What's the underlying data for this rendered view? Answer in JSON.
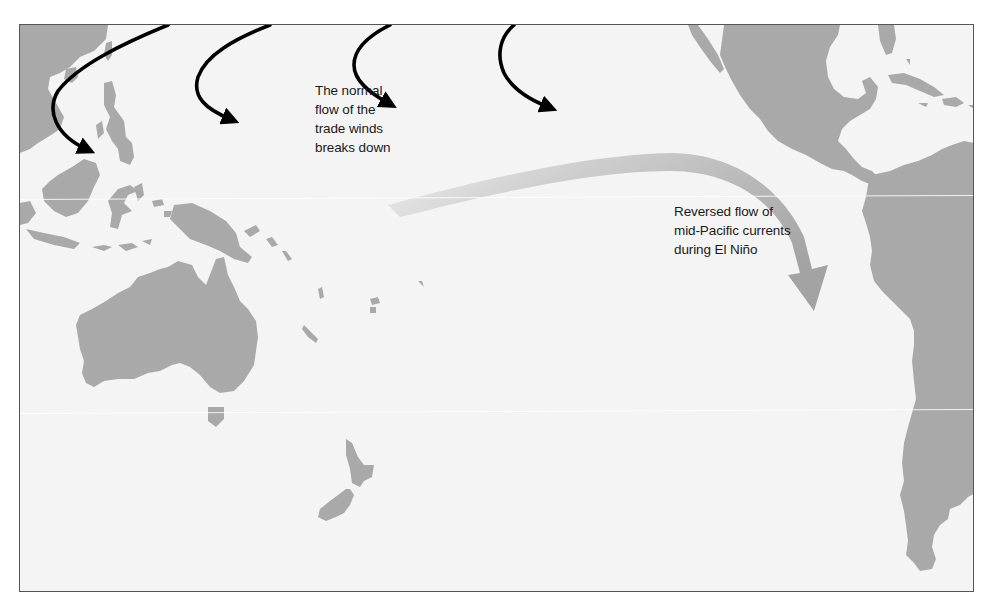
{
  "figure": {
    "colors": {
      "ocean": "#f4f4f4",
      "land": "#a9a9a9",
      "trade_wind_arrows": "#000000",
      "current_arrow_start": "#ebebeb",
      "current_arrow_end": "#a6a6a6",
      "border": "#555555"
    }
  },
  "annotations": {
    "trade_winds": {
      "lines": [
        "The normal",
        "flow of the",
        "trade winds",
        "breaks down"
      ]
    },
    "current": {
      "lines": [
        "Reversed flow of",
        "mid-Pacific currents",
        "during El Niño"
      ]
    }
  },
  "arrows": {
    "trade_wind_count": 4,
    "current_count": 1
  },
  "regions": [
    "Southeast Asia",
    "Philippines",
    "Indonesia",
    "New Guinea",
    "Australia",
    "Tasmania",
    "New Zealand",
    "Pacific islands",
    "Mexico",
    "Central America",
    "Caribbean",
    "South America"
  ]
}
